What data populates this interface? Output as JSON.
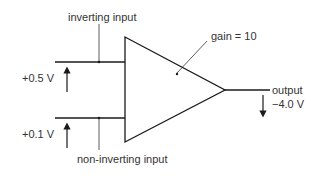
{
  "diagram": {
    "labels": {
      "inverting_input": "inverting input",
      "non_inverting_input": "non-inverting input",
      "gain": "gain = 10",
      "output": "output",
      "upper_voltage": "+0.5 V",
      "lower_voltage": "+0.1 V",
      "output_voltage": "−4.0 V"
    },
    "values": {
      "inverting_input_volts": 0.5,
      "non_inverting_input_volts": 0.1,
      "gain": 10,
      "output_volts": -4.0
    },
    "colors": {
      "stroke": "#1a1a1a",
      "text": "#333333",
      "background": "#ffffff"
    }
  }
}
